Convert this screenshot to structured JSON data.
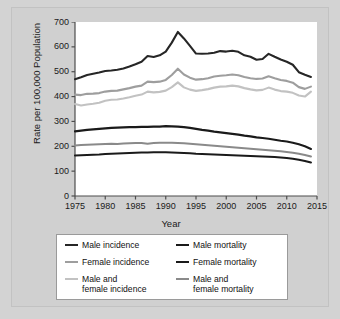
{
  "chart_data": {
    "type": "line",
    "title": "",
    "xlabel": "Year",
    "ylabel": "Rate per 100,000 Population",
    "xlim": [
      1975,
      2015
    ],
    "ylim": [
      0,
      700
    ],
    "xticks": [
      1975,
      1980,
      1985,
      1990,
      1995,
      2000,
      2005,
      2010,
      2015
    ],
    "yticks": [
      0,
      100,
      200,
      300,
      400,
      500,
      600,
      700
    ],
    "grid": false,
    "legend_position": "bottom",
    "x": [
      1975,
      1976,
      1977,
      1978,
      1979,
      1980,
      1981,
      1982,
      1983,
      1984,
      1985,
      1986,
      1987,
      1988,
      1989,
      1990,
      1991,
      1992,
      1993,
      1994,
      1995,
      1996,
      1997,
      1998,
      1999,
      2000,
      2001,
      2002,
      2003,
      2004,
      2005,
      2006,
      2007,
      2008,
      2009,
      2010,
      2011,
      2012,
      2013,
      2014
    ],
    "series": [
      {
        "name": "Male incidence",
        "color": "#262626",
        "width": 2.1,
        "values": [
          470,
          478,
          487,
          492,
          497,
          503,
          505,
          508,
          513,
          521,
          530,
          540,
          563,
          559,
          566,
          581,
          617,
          660,
          634,
          604,
          573,
          572,
          573,
          576,
          583,
          581,
          584,
          580,
          566,
          560,
          548,
          551,
          572,
          560,
          549,
          540,
          528,
          498,
          488,
          479
        ]
      },
      {
        "name": "Female incidence",
        "color": "#9e9e9e",
        "width": 2.1,
        "values": [
          408,
          406,
          411,
          412,
          414,
          420,
          423,
          424,
          429,
          434,
          440,
          444,
          460,
          458,
          460,
          467,
          487,
          512,
          489,
          476,
          468,
          470,
          474,
          481,
          484,
          486,
          489,
          486,
          479,
          474,
          471,
          473,
          482,
          474,
          467,
          463,
          456,
          438,
          431,
          440
        ]
      },
      {
        "name": "Male and female incidence",
        "color": "#c2c2c2",
        "width": 2.1,
        "values": [
          370,
          364,
          368,
          371,
          375,
          383,
          387,
          388,
          392,
          397,
          403,
          408,
          420,
          417,
          419,
          424,
          438,
          457,
          437,
          428,
          423,
          426,
          430,
          436,
          440,
          441,
          444,
          441,
          434,
          429,
          425,
          427,
          436,
          428,
          422,
          420,
          415,
          404,
          400,
          420
        ]
      },
      {
        "name": "Male mortality",
        "color": "#1a1a1a",
        "width": 2.1,
        "values": [
          260,
          263,
          266,
          268,
          270,
          272,
          274,
          275,
          276,
          277,
          277,
          278,
          278,
          279,
          279,
          281,
          280,
          279,
          277,
          274,
          270,
          266,
          263,
          259,
          256,
          253,
          250,
          247,
          243,
          240,
          236,
          233,
          230,
          226,
          222,
          219,
          214,
          208,
          200,
          189
        ]
      },
      {
        "name": "Female mortality",
        "color": "#1a1a1a",
        "width": 2.1,
        "values": [
          163,
          164,
          165,
          166,
          167,
          169,
          170,
          171,
          172,
          173,
          174,
          175,
          175,
          176,
          176,
          176,
          175,
          174,
          173,
          172,
          170,
          169,
          168,
          167,
          166,
          165,
          164,
          163,
          162,
          161,
          160,
          159,
          158,
          157,
          155,
          153,
          150,
          146,
          141,
          135
        ]
      },
      {
        "name": "Male and female mortality",
        "color": "#8a8a8a",
        "width": 2.1,
        "values": [
          203,
          205,
          206,
          207,
          208,
          209,
          210,
          209,
          211,
          212,
          213,
          213,
          210,
          213,
          214,
          214,
          214,
          213,
          212,
          210,
          208,
          206,
          204,
          202,
          200,
          198,
          196,
          194,
          192,
          190,
          188,
          186,
          184,
          182,
          180,
          177,
          174,
          170,
          165,
          159
        ]
      }
    ],
    "legend": [
      {
        "label": "Male incidence",
        "color": "#262626"
      },
      {
        "label": "Male mortality",
        "color": "#1a1a1a"
      },
      {
        "label": "Female incidence",
        "color": "#9e9e9e"
      },
      {
        "label": "Female mortality",
        "color": "#1a1a1a"
      },
      {
        "label": "Male and\nfemale incidence",
        "color": "#c2c2c2"
      },
      {
        "label": "Male and\nfemale mortality",
        "color": "#8a8a8a"
      }
    ]
  },
  "axis": {
    "ytick_labels": [
      "700",
      "600",
      "500",
      "400",
      "300",
      "200",
      "100",
      "0"
    ],
    "xtick_labels": [
      "1975",
      "1980",
      "1985",
      "1990",
      "1995",
      "2000",
      "2005",
      "2010",
      "2015"
    ],
    "ylabel": "Rate per 100,000 Population",
    "xlabel": "Year"
  },
  "legend": {
    "items": [
      {
        "label": "Male incidence"
      },
      {
        "label": "Male mortality"
      },
      {
        "label": "Female incidence"
      },
      {
        "label": "Female mortality"
      },
      {
        "label": "Male and\nfemale incidence"
      },
      {
        "label": "Male and\nfemale mortality"
      }
    ]
  },
  "colors": {
    "page_background": "#d3d3d3",
    "panel_background": "#d0d0d0",
    "plot_background": "#ffffff",
    "axis": "#4d4d4d",
    "text": "#1a1a1a"
  }
}
